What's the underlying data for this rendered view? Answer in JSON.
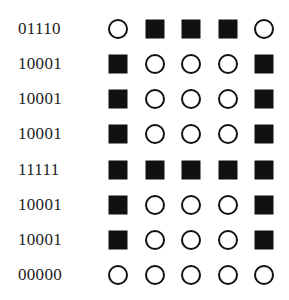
{
  "legend": {
    "filled_square": "1",
    "hollow_circle": "0"
  },
  "rows": [
    {
      "code": "01110",
      "bits": [
        0,
        1,
        1,
        1,
        0
      ]
    },
    {
      "code": "10001",
      "bits": [
        1,
        0,
        0,
        0,
        1
      ]
    },
    {
      "code": "10001",
      "bits": [
        1,
        0,
        0,
        0,
        1
      ]
    },
    {
      "code": "10001",
      "bits": [
        1,
        0,
        0,
        0,
        1
      ]
    },
    {
      "code": "11111",
      "bits": [
        1,
        1,
        1,
        1,
        1
      ]
    },
    {
      "code": "10001",
      "bits": [
        1,
        0,
        0,
        0,
        1
      ]
    },
    {
      "code": "10001",
      "bits": [
        1,
        0,
        0,
        0,
        1
      ]
    },
    {
      "code": "00000",
      "bits": [
        0,
        0,
        0,
        0,
        0
      ]
    }
  ]
}
